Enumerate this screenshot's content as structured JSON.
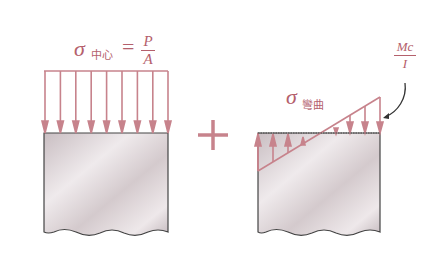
{
  "colors": {
    "stress": "#c7838c",
    "label": "#b4606c",
    "block_fill_light": "#efeaec",
    "block_fill_dark": "#c9bec2",
    "outline": "#444444",
    "leader": "#333333"
  },
  "left_diagram": {
    "label_symbol": "σ",
    "label_subscript": "中心",
    "equals": "=",
    "numerator": "P",
    "denominator": "A",
    "arrow_count": 9,
    "arrow_direction": "down"
  },
  "operator": "+",
  "right_diagram": {
    "label_symbol": "σ",
    "label_subscript": "彎曲",
    "max_label_numerator": "Mc",
    "max_label_denominator": "I",
    "up_arrow_count": 4,
    "down_arrow_count": 4
  }
}
